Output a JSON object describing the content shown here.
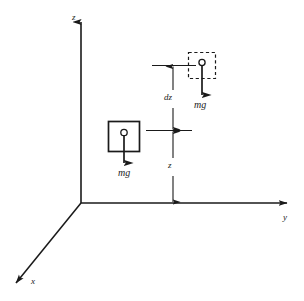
{
  "figure": {
    "name": "gravitational-potential-energy-diagram",
    "background_color": "#ffffff",
    "line_color": "#1a1a1a"
  },
  "axes": {
    "z": {
      "label": "z"
    },
    "y": {
      "label": "y"
    },
    "x": {
      "label": "x"
    }
  },
  "dimensions": [
    {
      "name": "dz",
      "label": "dz"
    },
    {
      "name": "z",
      "label": "z"
    }
  ],
  "blocks": [
    {
      "name": "displaced-block",
      "border_style": "dashed",
      "force": {
        "label": "mg",
        "direction": "down"
      }
    },
    {
      "name": "initial-block",
      "border_style": "solid",
      "force": {
        "label": "mg",
        "direction": "down"
      }
    }
  ]
}
